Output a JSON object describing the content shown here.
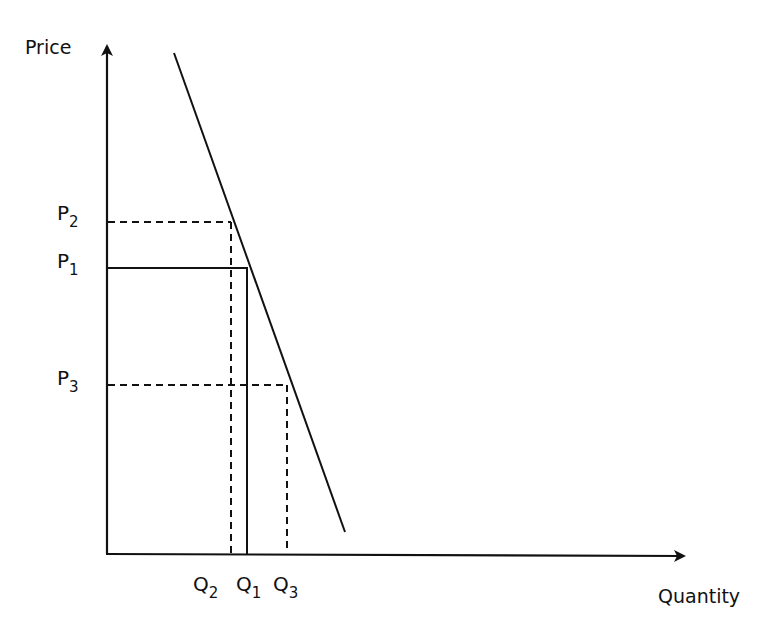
{
  "diagram": {
    "type": "supply-demand",
    "axes": {
      "y_label": "Price",
      "x_label": "Quantity"
    },
    "price_levels": [
      {
        "id": "P2",
        "base": "P",
        "sub": "2",
        "style": "dashed"
      },
      {
        "id": "P1",
        "base": "P",
        "sub": "1",
        "style": "solid"
      },
      {
        "id": "P3",
        "base": "P",
        "sub": "3",
        "style": "dashed"
      }
    ],
    "quantity_levels": [
      {
        "id": "Q2",
        "base": "Q",
        "sub": "2",
        "style": "dashed"
      },
      {
        "id": "Q1",
        "base": "Q",
        "sub": "1",
        "style": "solid"
      },
      {
        "id": "Q3",
        "base": "Q",
        "sub": "3",
        "style": "dashed"
      }
    ],
    "curves": [
      {
        "name": "demand-curve",
        "shape": "steep downward-sloping line"
      }
    ],
    "colors": {
      "line": "#111111",
      "background": "#ffffff"
    }
  },
  "labels": {
    "price": "Price",
    "quantity": "Quantity",
    "p2_base": "P",
    "p2_sub": "2",
    "p1_base": "P",
    "p1_sub": "1",
    "p3_base": "P",
    "p3_sub": "3",
    "q2_base": "Q",
    "q2_sub": "2",
    "q1_base": "Q",
    "q1_sub": "1",
    "q3_base": "Q",
    "q3_sub": "3"
  }
}
